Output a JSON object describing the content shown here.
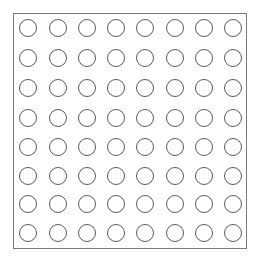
{
  "grid": {
    "rows": 8,
    "cols": 8,
    "stroke_color": "#5a5a5a",
    "frame_color": "#7a7a7a",
    "col_centers": [
      28,
      58,
      87,
      116,
      145,
      175,
      204,
      233
    ],
    "row_centers": [
      28,
      58,
      88,
      118,
      147,
      176,
      204,
      233
    ],
    "cells": [
      [
        0,
        0,
        0,
        0,
        0,
        0,
        0,
        0
      ],
      [
        0,
        0,
        0,
        0,
        0,
        0,
        0,
        0
      ],
      [
        0,
        0,
        0,
        0,
        0,
        0,
        0,
        0
      ],
      [
        0,
        0,
        0,
        0,
        0,
        0,
        0,
        0
      ],
      [
        0,
        0,
        0,
        0,
        0,
        0,
        0,
        0
      ],
      [
        0,
        0,
        0,
        0,
        0,
        0,
        0,
        0
      ],
      [
        0,
        0,
        0,
        0,
        0,
        0,
        0,
        0
      ],
      [
        0,
        0,
        0,
        0,
        0,
        0,
        0,
        0
      ]
    ]
  }
}
